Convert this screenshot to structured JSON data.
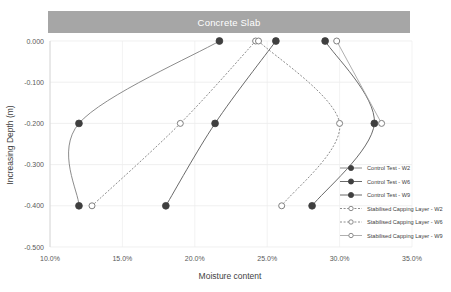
{
  "banner": {
    "label": "Concrete Slab",
    "color": "#a6a6a6"
  },
  "chart_data": {
    "type": "line",
    "title": "Concrete Slab",
    "xlabel": "Moisture content",
    "ylabel": "Increasing Depth (m)",
    "xlim": [
      10.0,
      35.0
    ],
    "ylim": [
      -0.5,
      0.0
    ],
    "xticks": [
      "10.0%",
      "15.0%",
      "20.0%",
      "25.0%",
      "30.0%",
      "35.0%"
    ],
    "xtick_values": [
      10.0,
      15.0,
      20.0,
      25.0,
      30.0,
      35.0
    ],
    "yticks": [
      "0.000",
      "-0.100",
      "-0.200",
      "-0.300",
      "-0.400",
      "-0.500"
    ],
    "ytick_values": [
      0.0,
      -0.1,
      -0.2,
      -0.3,
      -0.4,
      -0.5
    ],
    "grid": true,
    "legend_position": "right",
    "marker_filled_color": "#3f3f3f",
    "marker_open_color": "#7f7f7f",
    "series": [
      {
        "name": "Control Test - W2",
        "style": "solid",
        "marker": "filled",
        "color": "#7f7f7f",
        "points": [
          {
            "x": 21.7,
            "y": 0.0
          },
          {
            "x": 12.0,
            "y": -0.2
          },
          {
            "x": 12.0,
            "y": -0.4
          }
        ]
      },
      {
        "name": "Control Test - W6",
        "style": "solid",
        "marker": "filled",
        "color": "#595959",
        "points": [
          {
            "x": 25.6,
            "y": 0.0
          },
          {
            "x": 21.4,
            "y": -0.2
          },
          {
            "x": 18.0,
            "y": -0.4
          }
        ]
      },
      {
        "name": "Control Test - W9",
        "style": "solid",
        "marker": "filled",
        "color": "#595959",
        "points": [
          {
            "x": 29.0,
            "y": 0.0
          },
          {
            "x": 32.4,
            "y": -0.2
          },
          {
            "x": 28.1,
            "y": -0.4
          }
        ]
      },
      {
        "name": "Stabilised Capping Layer - W2",
        "style": "dotted",
        "marker": "open",
        "color": "#808080",
        "points": [
          {
            "x": 24.2,
            "y": 0.0
          },
          {
            "x": 19.0,
            "y": -0.2
          },
          {
            "x": 12.9,
            "y": -0.4
          }
        ]
      },
      {
        "name": "Stabilised Capping Layer - W6",
        "style": "dotted",
        "marker": "open",
        "color": "#808080",
        "points": [
          {
            "x": 24.4,
            "y": 0.0
          },
          {
            "x": 30.0,
            "y": -0.2
          },
          {
            "x": 26.0,
            "y": -0.4
          }
        ]
      },
      {
        "name": "Stabilised Capping Layer - W9",
        "style": "solid",
        "marker": "open",
        "color": "#a6a6a6",
        "points": [
          {
            "x": 29.8,
            "y": 0.0
          },
          {
            "x": 32.9,
            "y": -0.2
          }
        ]
      }
    ]
  },
  "legend": {
    "items": [
      {
        "label": "Control Test - W2",
        "style": "solid",
        "marker": "filled"
      },
      {
        "label": "Control Test - W6",
        "style": "solid",
        "marker": "filled"
      },
      {
        "label": "Control Test - W9",
        "style": "solid",
        "marker": "filled"
      },
      {
        "label": "Stabilised Capping Layer - W2",
        "style": "dotted",
        "marker": "open"
      },
      {
        "label": "Stabilised Capping Layer - W6",
        "style": "dotted",
        "marker": "open"
      },
      {
        "label": "Stabilised Capping Layer - W9",
        "style": "solid",
        "marker": "open"
      }
    ]
  }
}
